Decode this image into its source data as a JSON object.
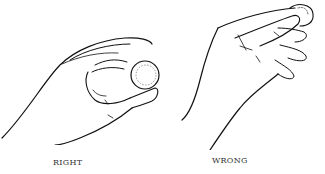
{
  "page": {
    "top_text": "...illustration of a hand-holding grip (cropped)",
    "figures": [
      {
        "id": "right",
        "caption": "RIGHT",
        "description": "Hand holding a coin between thumb and index finger, fingertips gently"
      },
      {
        "id": "wrong",
        "caption": "WRONG",
        "description": "Hand gripping a coin with thumb pressed flat against it"
      }
    ]
  }
}
